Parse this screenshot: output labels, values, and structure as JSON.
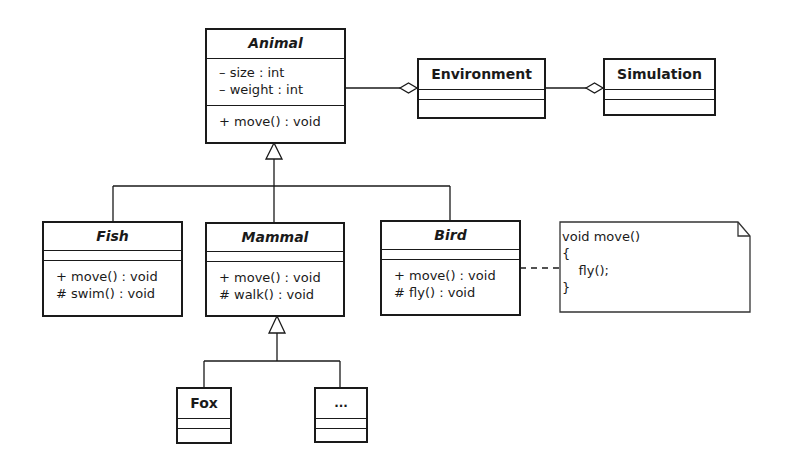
{
  "diagram": {
    "type": "UML class diagram",
    "classes": {
      "animal": {
        "name": "Animal",
        "abstract": true,
        "attributes": [
          "– size : int",
          "– weight : int"
        ],
        "operations": [
          "+ move() : void"
        ]
      },
      "environment": {
        "name": "Environment",
        "abstract": false,
        "attributes": [],
        "operations": []
      },
      "simulation": {
        "name": "Simulation",
        "abstract": false,
        "attributes": [],
        "operations": []
      },
      "fish": {
        "name": "Fish",
        "abstract": true,
        "attributes": [],
        "operations": [
          "+ move() : void",
          "# swim() : void"
        ]
      },
      "mammal": {
        "name": "Mammal",
        "abstract": true,
        "attributes": [],
        "operations": [
          "+ move() : void",
          "# walk() : void"
        ]
      },
      "bird": {
        "name": "Bird",
        "abstract": true,
        "attributes": [],
        "operations": [
          "+ move() : void",
          "# fly() : void"
        ]
      },
      "fox": {
        "name": "Fox",
        "abstract": false,
        "attributes": [],
        "operations": []
      },
      "more": {
        "name": "...",
        "abstract": false,
        "attributes": [],
        "operations": []
      }
    },
    "note": {
      "lines": [
        "void move()",
        "{",
        "    fly();",
        "}"
      ],
      "attached_to": "Bird"
    },
    "relationships": [
      {
        "type": "aggregation",
        "whole": "Environment",
        "part": "Animal"
      },
      {
        "type": "aggregation",
        "whole": "Simulation",
        "part": "Environment"
      },
      {
        "type": "generalization",
        "child": "Fish",
        "parent": "Animal"
      },
      {
        "type": "generalization",
        "child": "Mammal",
        "parent": "Animal"
      },
      {
        "type": "generalization",
        "child": "Bird",
        "parent": "Animal"
      },
      {
        "type": "generalization",
        "child": "Fox",
        "parent": "Mammal"
      },
      {
        "type": "generalization",
        "child": "...",
        "parent": "Mammal"
      },
      {
        "type": "note-link",
        "from": "Bird",
        "to": "note"
      }
    ]
  }
}
